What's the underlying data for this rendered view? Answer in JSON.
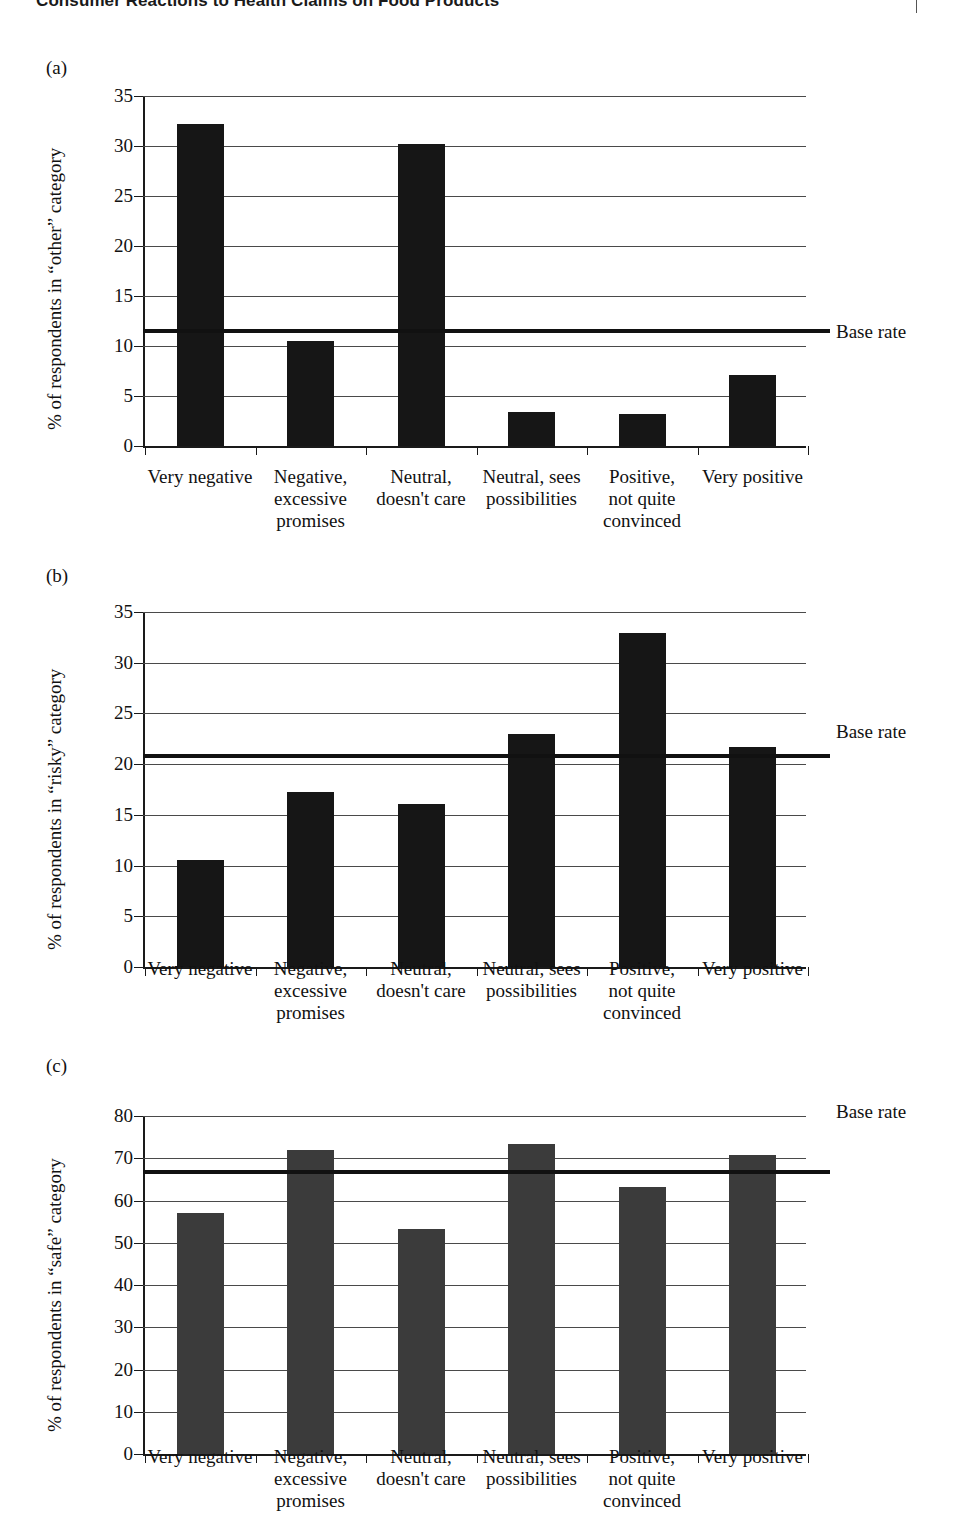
{
  "header": {
    "title": "Consumer Reactions to Health Claims on Food Products",
    "clipped": true
  },
  "legend_label": "Base rate",
  "categories": [
    "Very negative",
    "Negative, excessive promises",
    "Neutral, doesn't care",
    "Neutral, sees possibilities",
    "Positive, not quite convinced",
    "Very positive"
  ],
  "category_lines": [
    [
      "Very negative"
    ],
    [
      "Negative,",
      "excessive",
      "promises"
    ],
    [
      "Neutral,",
      "doesn't care"
    ],
    [
      "Neutral, sees",
      "possibilities"
    ],
    [
      "Positive,",
      "not quite",
      "convinced"
    ],
    [
      "Very positive"
    ]
  ],
  "panels": [
    {
      "tag": "(a)",
      "ylabel": "% of respondents in “other” category",
      "ticks": [
        "0",
        "5",
        "10",
        "15",
        "20",
        "25",
        "30",
        "35"
      ],
      "base_rate": 11.5
    },
    {
      "tag": "(b)",
      "ylabel": "% of respondents in “risky” category",
      "ticks": [
        "0",
        "5",
        "10",
        "15",
        "20",
        "25",
        "30",
        "35"
      ],
      "base_rate": 20.8
    },
    {
      "tag": "(c)",
      "ylabel": "% of respondents in “safe” category",
      "ticks": [
        "0",
        "10",
        "20",
        "30",
        "40",
        "50",
        "60",
        "70",
        "80"
      ],
      "base_rate": 66.8
    }
  ],
  "chart_data": [
    {
      "type": "bar",
      "panel": "(a)",
      "title": "",
      "xlabel": "",
      "ylabel": "% of respondents in “other” category",
      "categories": [
        "Very negative",
        "Negative, excessive promises",
        "Neutral, doesn't care",
        "Neutral, sees possibilities",
        "Positive, not quite convinced",
        "Very positive"
      ],
      "values": [
        32.2,
        10.5,
        30.2,
        3.4,
        3.2,
        7.1
      ],
      "ylim": [
        0,
        35
      ],
      "yticks": [
        0,
        5,
        10,
        15,
        20,
        25,
        30,
        35
      ],
      "grid": true,
      "annotations": [
        {
          "name": "Base rate",
          "type": "hline",
          "value": 11.5
        }
      ],
      "legend": {
        "entries": [
          "Base rate"
        ],
        "position": "right"
      },
      "bar_color": "#161616"
    },
    {
      "type": "bar",
      "panel": "(b)",
      "title": "",
      "xlabel": "",
      "ylabel": "% of respondents in “risky” category",
      "categories": [
        "Very negative",
        "Negative, excessive promises",
        "Neutral, doesn't care",
        "Neutral, sees possibilities",
        "Positive, not quite convinced",
        "Very positive"
      ],
      "values": [
        10.6,
        17.3,
        16.1,
        23.0,
        32.9,
        21.7
      ],
      "ylim": [
        0,
        35
      ],
      "yticks": [
        0,
        5,
        10,
        15,
        20,
        25,
        30,
        35
      ],
      "grid": true,
      "annotations": [
        {
          "name": "Base rate",
          "type": "hline",
          "value": 20.8
        }
      ],
      "legend": {
        "entries": [
          "Base rate"
        ],
        "position": "right"
      },
      "bar_color": "#161616"
    },
    {
      "type": "bar",
      "panel": "(c)",
      "title": "",
      "xlabel": "",
      "ylabel": "% of respondents in “safe” category",
      "categories": [
        "Very negative",
        "Negative, excessive promises",
        "Neutral, doesn't care",
        "Neutral, sees possibilities",
        "Positive, not quite convinced",
        "Very positive"
      ],
      "values": [
        57.0,
        72.0,
        53.3,
        73.3,
        63.3,
        70.8
      ],
      "ylim": [
        0,
        80
      ],
      "yticks": [
        0,
        10,
        20,
        30,
        40,
        50,
        60,
        70,
        80
      ],
      "grid": true,
      "annotations": [
        {
          "name": "Base rate",
          "type": "hline",
          "value": 66.8
        }
      ],
      "legend": {
        "entries": [
          "Base rate"
        ],
        "position": "right"
      },
      "bar_color": "#3b3b3b"
    }
  ]
}
